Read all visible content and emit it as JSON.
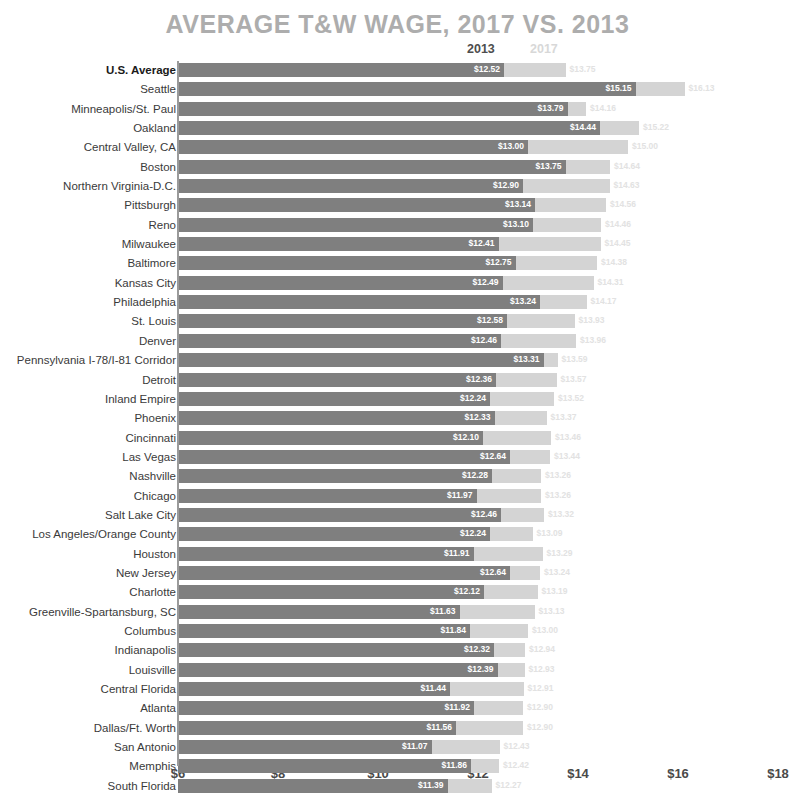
{
  "chart_data": {
    "type": "bar",
    "title": "AVERAGE T&W WAGE, 2017 VS. 2013",
    "orientation": "horizontal",
    "grouped": true,
    "xlabel": "",
    "ylabel": "",
    "xlim": [
      6,
      18
    ],
    "xticks": [
      "$6",
      "$8",
      "$10",
      "$12",
      "$14",
      "$16",
      "$18"
    ],
    "xtick_values": [
      6,
      8,
      10,
      12,
      14,
      16,
      18
    ],
    "grid": false,
    "legend": [
      {
        "name": "2013",
        "color": "#7f7f7f"
      },
      {
        "name": "2017",
        "color": "#d4d4d4"
      }
    ],
    "legend_position": "top",
    "categories": [
      "U.S. Average",
      "Seattle",
      "Minneapolis/St. Paul",
      "Oakland",
      "Central Valley, CA",
      "Boston",
      "Northern Virginia-D.C.",
      "Pittsburgh",
      "Reno",
      "Milwaukee",
      "Baltimore",
      "Kansas City",
      "Philadelphia",
      "St. Louis",
      "Denver",
      "Pennsylvania I-78/I-81 Corridor",
      "Detroit",
      "Inland Empire",
      "Phoenix",
      "Cincinnati",
      "Las Vegas",
      "Nashville",
      "Chicago",
      "Salt Lake City",
      "Los Angeles/Orange County",
      "Houston",
      "New Jersey",
      "Charlotte",
      "Greenville-Spartansburg, SC",
      "Columbus",
      "Indianapolis",
      "Louisville",
      "Central Florida",
      "Atlanta",
      "Dallas/Ft. Worth",
      "San Antonio",
      "Memphis",
      "South Florida"
    ],
    "series": [
      {
        "name": "2013",
        "color": "#7f7f7f",
        "values": [
          12.52,
          15.15,
          13.79,
          14.44,
          13.0,
          13.75,
          12.9,
          13.14,
          13.1,
          12.41,
          12.75,
          12.49,
          13.24,
          12.58,
          12.46,
          13.31,
          12.36,
          12.24,
          12.33,
          12.1,
          12.64,
          12.28,
          11.97,
          12.46,
          12.24,
          11.91,
          12.64,
          12.12,
          11.63,
          11.84,
          12.32,
          12.39,
          11.44,
          11.92,
          11.56,
          11.07,
          11.86,
          11.39
        ],
        "labels": [
          "$12.52",
          "$15.15",
          "$13.79",
          "$14.44",
          "$13.00",
          "$13.75",
          "$12.90",
          "$13.14",
          "$13.10",
          "$12.41",
          "$12.75",
          "$12.49",
          "$13.24",
          "$12.58",
          "$12.46",
          "$13.31",
          "$12.36",
          "$12.24",
          "$12.33",
          "$12.10",
          "$12.64",
          "$12.28",
          "$11.97",
          "$12.46",
          "$12.24",
          "$11.91",
          "$12.64",
          "$12.12",
          "$11.63",
          "$11.84",
          "$12.32",
          "$12.39",
          "$11.44",
          "$11.92",
          "$11.56",
          "$11.07",
          "$11.86",
          "$11.39"
        ]
      },
      {
        "name": "2017",
        "color": "#d4d4d4",
        "values": [
          13.75,
          16.13,
          14.16,
          15.22,
          15.0,
          14.64,
          14.63,
          14.56,
          14.46,
          14.45,
          14.38,
          14.31,
          14.17,
          13.93,
          13.96,
          13.59,
          13.57,
          13.52,
          13.37,
          13.46,
          13.44,
          13.26,
          13.26,
          13.32,
          13.09,
          13.29,
          13.24,
          13.19,
          13.13,
          13.0,
          12.94,
          12.93,
          12.91,
          12.9,
          12.9,
          12.43,
          12.42,
          12.27
        ],
        "labels": [
          "$13.75",
          "$16.13",
          "$14.16",
          "$15.22",
          "$15.00",
          "$14.64",
          "$14.63",
          "$14.56",
          "$14.46",
          "$14.45",
          "$14.38",
          "$14.31",
          "$14.17",
          "$13.93",
          "$13.96",
          "$13.59",
          "$13.57",
          "$13.52",
          "$13.37",
          "$13.46",
          "$13.44",
          "$13.26",
          "$13.26",
          "$13.32",
          "$13.09",
          "$13.29",
          "$13.24",
          "$13.19",
          "$13.13",
          "$13.00",
          "$12.94",
          "$12.93",
          "$12.91",
          "$12.90",
          "$12.90",
          "$12.43",
          "$12.42",
          "$12.27"
        ]
      }
    ]
  }
}
